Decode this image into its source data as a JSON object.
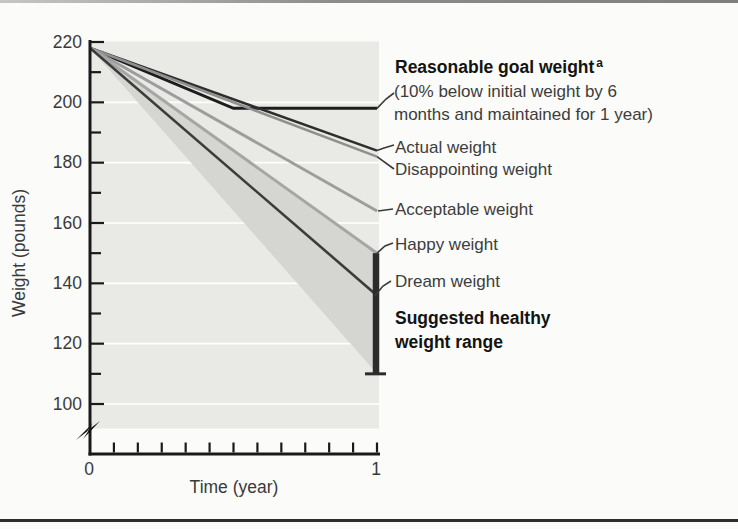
{
  "chart_data": {
    "type": "line",
    "title": "",
    "xlabel": "Time (year)",
    "ylabel": "Weight (pounds)",
    "xlim": [
      0,
      1
    ],
    "ylim_displayed": [
      100,
      220
    ],
    "y_axis_break_below": 100,
    "yticks": [
      220,
      200,
      180,
      160,
      140,
      120,
      100
    ],
    "y_minor_tick_step": 10,
    "xticks": [
      "0",
      "1"
    ],
    "x_minor_tick_count": 12,
    "grid": "white horizontal gridlines at 20-lb intervals on gray panel",
    "initial_weight": 218,
    "series": [
      {
        "name": "Reasonable goal weight (10% below initial weight by 6 months and maintained for 1 year)",
        "points": [
          [
            0,
            218
          ],
          [
            0.5,
            198
          ],
          [
            1,
            198
          ]
        ],
        "color": "#1d1d1d",
        "width": 3
      },
      {
        "name": "Actual weight",
        "points": [
          [
            0,
            218
          ],
          [
            1,
            184
          ]
        ],
        "color": "#2e2e2e",
        "width": 2.6
      },
      {
        "name": "Disappointing weight",
        "points": [
          [
            0,
            218
          ],
          [
            1,
            182
          ]
        ],
        "color": "#8f8f8f",
        "width": 2.6
      },
      {
        "name": "Acceptable weight",
        "points": [
          [
            0,
            218
          ],
          [
            1,
            164
          ]
        ],
        "color": "#9d9d9d",
        "width": 3
      },
      {
        "name": "Happy weight",
        "points": [
          [
            0,
            218
          ],
          [
            1,
            150
          ]
        ],
        "color": "#a6a6a6",
        "width": 3
      },
      {
        "name": "Dream weight",
        "points": [
          [
            0,
            218
          ],
          [
            1,
            136
          ]
        ],
        "color": "#3c3c3c",
        "width": 2.6
      }
    ],
    "shaded_band": {
      "label": "Suggested healthy weight range",
      "apex": [
        0,
        218
      ],
      "at_one_year": [
        110,
        150
      ],
      "fill": "#d5d5d1"
    },
    "range_bar": {
      "x": 1,
      "from": 110,
      "to": 150,
      "color": "#2c2c2c"
    },
    "plot_bg": "#e9e9e6",
    "gridline_color": "#ffffff",
    "axis_color": "#1a1a1a",
    "legend_position": "right-side annotations with leader lines"
  },
  "axes": {
    "y_title": "Weight (pounds)",
    "x_title": "Time (year)"
  },
  "annotations": {
    "reasonable_title": "Reasonable goal weight",
    "reasonable_sup": "a",
    "reasonable_desc_1": "(10% below initial weight by 6",
    "reasonable_desc_2": "months and maintained for 1 year)",
    "actual": "Actual weight",
    "disappointing": "Disappointing weight",
    "acceptable": "Acceptable weight",
    "happy": "Happy weight",
    "dream": "Dream weight",
    "range_1": "Suggested healthy",
    "range_2": "weight range"
  }
}
